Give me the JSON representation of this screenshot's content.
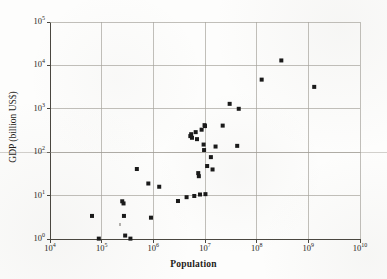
{
  "chart_data": {
    "type": "scatter",
    "title": "",
    "xlabel": "Population",
    "ylabel": "GDP (billion US$)",
    "xscale": "log",
    "yscale": "log",
    "xlim": [
      10000,
      10000000000
    ],
    "ylim": [
      1,
      100000
    ],
    "grid": true,
    "legend": "none",
    "marker": {
      "shape": "square",
      "color": "#1a1a1a",
      "size_px": 4
    },
    "x_tick_labels": [
      "10⁴",
      "10⁵",
      "10⁶",
      "10⁷",
      "10⁸",
      "10⁹",
      "10¹⁰"
    ],
    "x_tick_mantissa": [
      "10",
      "10",
      "10",
      "10",
      "10",
      "10",
      "10"
    ],
    "x_tick_exponent": [
      "4",
      "5",
      "6",
      "7",
      "8",
      "9",
      "10"
    ],
    "x_tick_values": [
      10000,
      100000,
      1000000,
      10000000,
      100000000,
      1000000000,
      10000000000
    ],
    "y_tick_labels": [
      "10⁰",
      "10¹",
      "10²",
      "10³",
      "10⁴",
      "10⁵"
    ],
    "y_tick_mantissa": [
      "10",
      "10",
      "10",
      "10",
      "10",
      "10"
    ],
    "y_tick_exponent": [
      "0",
      "1",
      "2",
      "3",
      "4",
      "5"
    ],
    "y_tick_values": [
      1,
      10,
      100,
      1000,
      10000,
      100000
    ],
    "points": [
      {
        "x": 65000,
        "y": 3.4
      },
      {
        "x": 88000,
        "y": 1.02
      },
      {
        "x": 250000,
        "y": 7.4
      },
      {
        "x": 265000,
        "y": 6.6
      },
      {
        "x": 270000,
        "y": 3.4
      },
      {
        "x": 285000,
        "y": 1.2
      },
      {
        "x": 360000,
        "y": 1.02
      },
      {
        "x": 480000,
        "y": 41
      },
      {
        "x": 800000,
        "y": 19
      },
      {
        "x": 900000,
        "y": 3.1
      },
      {
        "x": 1300000,
        "y": 16
      },
      {
        "x": 3000000,
        "y": 7.5
      },
      {
        "x": 4400000,
        "y": 9.2
      },
      {
        "x": 5200000,
        "y": 235
      },
      {
        "x": 5400000,
        "y": 260
      },
      {
        "x": 5600000,
        "y": 215
      },
      {
        "x": 6200000,
        "y": 9.8
      },
      {
        "x": 6600000,
        "y": 290
      },
      {
        "x": 7000000,
        "y": 200
      },
      {
        "x": 7400000,
        "y": 33
      },
      {
        "x": 7600000,
        "y": 28
      },
      {
        "x": 8000000,
        "y": 10.6
      },
      {
        "x": 8600000,
        "y": 330
      },
      {
        "x": 9400000,
        "y": 150
      },
      {
        "x": 9600000,
        "y": 112
      },
      {
        "x": 9800000,
        "y": 420
      },
      {
        "x": 10000000,
        "y": 400
      },
      {
        "x": 10200000,
        "y": 10.8
      },
      {
        "x": 11000000,
        "y": 48
      },
      {
        "x": 13000000,
        "y": 77
      },
      {
        "x": 14000000,
        "y": 40
      },
      {
        "x": 16000000,
        "y": 135
      },
      {
        "x": 22000000,
        "y": 410
      },
      {
        "x": 30000000,
        "y": 1300
      },
      {
        "x": 42000000,
        "y": 140
      },
      {
        "x": 45000000,
        "y": 1000
      },
      {
        "x": 125000000,
        "y": 4700
      },
      {
        "x": 300000000,
        "y": 13000
      },
      {
        "x": 1300000000,
        "y": 3200
      }
    ]
  },
  "axes": {
    "x_title": "Population",
    "y_title": "GDP (billion US$)"
  }
}
